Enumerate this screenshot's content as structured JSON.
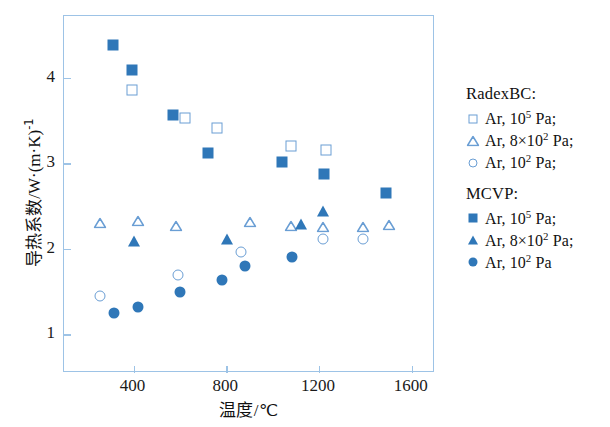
{
  "chart_data": {
    "type": "scatter",
    "title": "",
    "xlabel": "温度/℃",
    "ylabel": "导热系数/W·(m·K)⁻¹",
    "xlabel_text": "温度",
    "xlabel_unit": "/℃",
    "ylabel_text": "导热系数",
    "ylabel_unit": "/W·(m·K)",
    "ylabel_exp": "-1",
    "xlim": [
      100,
      1700
    ],
    "ylim": [
      0.55,
      4.72
    ],
    "xticks": [
      400,
      800,
      1200,
      1600
    ],
    "yticks": [
      1,
      2,
      3,
      4
    ],
    "grid": false,
    "legend_position": "right-outside",
    "series": [
      {
        "name": "RadexBC: Ar, 10^5 Pa",
        "marker": "square-open",
        "color": "#6a9ed4",
        "points": [
          {
            "x": 395,
            "y": 3.85
          },
          {
            "x": 620,
            "y": 3.53
          },
          {
            "x": 760,
            "y": 3.41
          },
          {
            "x": 1080,
            "y": 3.2
          },
          {
            "x": 1230,
            "y": 3.15
          }
        ]
      },
      {
        "name": "RadexBC: Ar, 8×10^2 Pa",
        "marker": "triangle-open",
        "color": "#6a9ed4",
        "points": [
          {
            "x": 255,
            "y": 2.3
          },
          {
            "x": 420,
            "y": 2.33
          },
          {
            "x": 585,
            "y": 2.27
          },
          {
            "x": 900,
            "y": 2.31
          },
          {
            "x": 1080,
            "y": 2.27
          },
          {
            "x": 1215,
            "y": 2.26
          },
          {
            "x": 1390,
            "y": 2.25
          },
          {
            "x": 1500,
            "y": 2.28
          }
        ]
      },
      {
        "name": "RadexBC: Ar, 10^2 Pa",
        "marker": "circle-open",
        "color": "#6a9ed4",
        "points": [
          {
            "x": 255,
            "y": 1.45
          },
          {
            "x": 590,
            "y": 1.7
          },
          {
            "x": 865,
            "y": 1.96
          },
          {
            "x": 1215,
            "y": 2.12
          },
          {
            "x": 1390,
            "y": 2.11
          }
        ]
      },
      {
        "name": "MCVP: Ar, 10^5 Pa",
        "marker": "square-filled",
        "color": "#2f77b8",
        "points": [
          {
            "x": 310,
            "y": 4.38
          },
          {
            "x": 395,
            "y": 4.09
          },
          {
            "x": 570,
            "y": 3.56
          },
          {
            "x": 720,
            "y": 3.12
          },
          {
            "x": 1040,
            "y": 3.02
          },
          {
            "x": 1220,
            "y": 2.88
          },
          {
            "x": 1490,
            "y": 2.65
          }
        ]
      },
      {
        "name": "MCVP: Ar, 8×10^2 Pa",
        "marker": "triangle-filled",
        "color": "#2f77b8",
        "points": [
          {
            "x": 400,
            "y": 2.09
          },
          {
            "x": 805,
            "y": 2.11
          },
          {
            "x": 1120,
            "y": 2.29
          },
          {
            "x": 1215,
            "y": 2.44
          }
        ]
      },
      {
        "name": "MCVP: Ar, 10^2 Pa",
        "marker": "circle-filled",
        "color": "#2f77b8",
        "points": [
          {
            "x": 315,
            "y": 1.25
          },
          {
            "x": 420,
            "y": 1.32
          },
          {
            "x": 600,
            "y": 1.5
          },
          {
            "x": 780,
            "y": 1.64
          },
          {
            "x": 880,
            "y": 1.8
          },
          {
            "x": 1085,
            "y": 1.9
          }
        ]
      }
    ]
  },
  "legend": {
    "groups": [
      {
        "title": "RadexBC:",
        "entries": [
          {
            "marker": "square-open",
            "gas": "Ar, 10",
            "exp": "5",
            "tail": " Pa;"
          },
          {
            "marker": "triangle-open",
            "gas": "Ar, 8×10",
            "exp": "2",
            "tail": " Pa;"
          },
          {
            "marker": "circle-open",
            "gas": "Ar, 10",
            "exp": "2",
            "tail": " Pa;"
          }
        ]
      },
      {
        "title": "MCVP:",
        "entries": [
          {
            "marker": "square-filled",
            "gas": "Ar, 10",
            "exp": "5",
            "tail": " Pa;"
          },
          {
            "marker": "triangle-filled",
            "gas": "Ar, 8×10",
            "exp": "2",
            "tail": " Pa;"
          },
          {
            "marker": "circle-filled",
            "gas": "Ar, 10",
            "exp": "2",
            "tail": " Pa"
          }
        ]
      }
    ]
  },
  "axis": {
    "xtick_labels": [
      "400",
      "800",
      "1200",
      "1600"
    ],
    "ytick_labels": [
      "1",
      "2",
      "3",
      "4"
    ]
  },
  "colors": {
    "filled": "#2f77b8",
    "open_stroke": "#6a9ed4",
    "frame": "#9dc3e6",
    "text": "#111111"
  }
}
